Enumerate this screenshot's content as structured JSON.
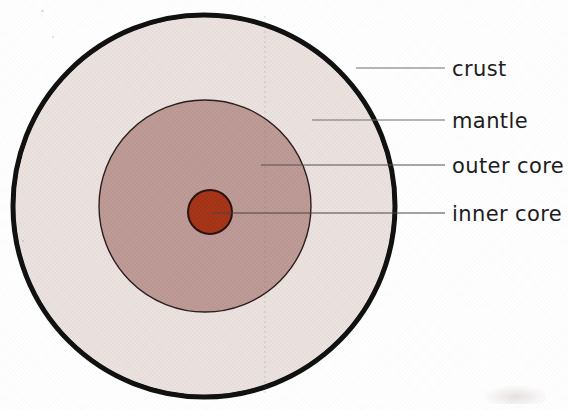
{
  "document": {
    "title": "Earth Internal Structure Diagram",
    "background_color": "#ffffff",
    "width": 568,
    "height": 410
  },
  "diagram": {
    "type": "cross-section-concentric-circles",
    "center": {
      "x": 204,
      "y": 206
    },
    "layers": [
      {
        "key": "crust",
        "label": "crust",
        "shape": "circle-outline",
        "cx": 204,
        "cy": 206,
        "r": 192,
        "fill_color": "#EBE2DF",
        "stroke_color": "#111111",
        "stroke_width": 5
      },
      {
        "key": "mantle",
        "label": "mantle",
        "shape": "annulus",
        "outer_r": 190,
        "inner_r": 107,
        "fill_color": "#EBE2DF",
        "stroke_color": "none",
        "stroke_width": 0
      },
      {
        "key": "outer_core",
        "label": "outer core",
        "shape": "circle",
        "cx": 205,
        "cy": 206,
        "r": 107,
        "fill_color": "#BE9A96",
        "stroke_color": "#2b1f1d",
        "stroke_width": 1.4
      },
      {
        "key": "inner_core",
        "label": "inner core",
        "shape": "circle",
        "cx": 210,
        "cy": 212,
        "r": 22,
        "fill_color": "#A63518",
        "stroke_color": "#2b1310",
        "stroke_width": 2
      }
    ],
    "callouts": [
      {
        "key": "crust",
        "label": "crust",
        "line": {
          "x1": 356,
          "y1": 68,
          "x2": 445,
          "y2": 68
        },
        "text": {
          "x": 452,
          "y": 76
        },
        "line_color": "#6f6f6f"
      },
      {
        "key": "mantle",
        "label": "mantle",
        "line": {
          "x1": 312,
          "y1": 120,
          "x2": 445,
          "y2": 120
        },
        "text": {
          "x": 452,
          "y": 128
        },
        "line_color": "#6f6f6f"
      },
      {
        "key": "outer_core",
        "label": "outer core",
        "line": {
          "x1": 261,
          "y1": 165,
          "x2": 445,
          "y2": 165
        },
        "text": {
          "x": 452,
          "y": 173
        },
        "line_color": "#55504f"
      },
      {
        "key": "inner_core",
        "label": "inner core",
        "line": {
          "x1": 212,
          "y1": 213,
          "x2": 445,
          "y2": 213
        },
        "text": {
          "x": 452,
          "y": 221
        },
        "line_color": "#4a4442"
      }
    ]
  },
  "labels": {
    "crust": "crust",
    "mantle": "mantle",
    "outer_core": "outer core",
    "inner_core": "inner core"
  },
  "colors": {
    "page_background": "#ffffff",
    "crust_outline": "#111111",
    "mantle_fill": "#EBE2DF",
    "outer_core_fill": "#BE9A96",
    "inner_core_fill": "#A63518",
    "label_text": "#1d1d1d",
    "leader_line": "#6f6f6f"
  }
}
